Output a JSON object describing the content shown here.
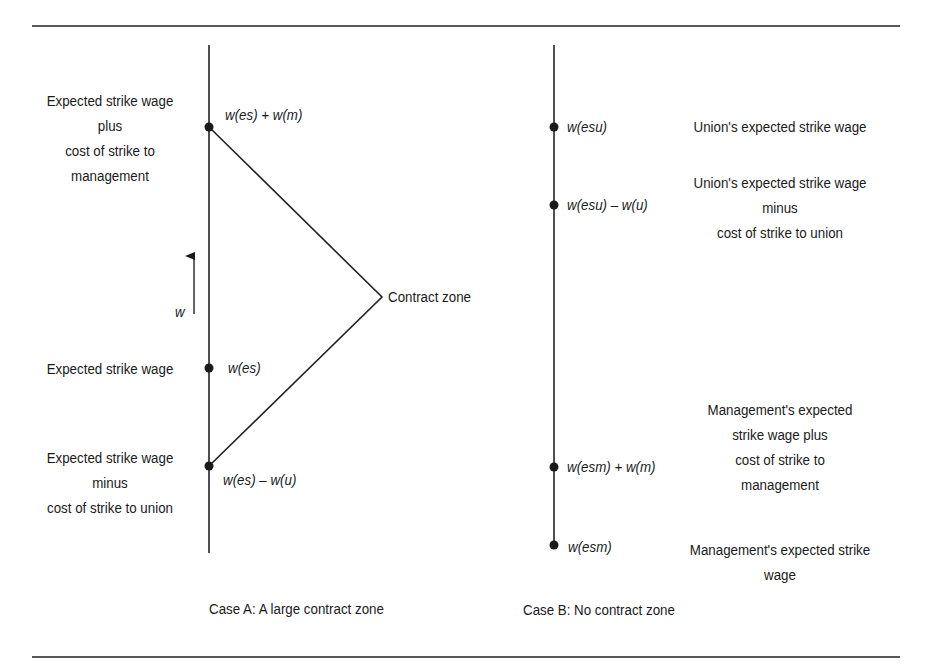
{
  "figure": {
    "rules": {
      "top_y": 26,
      "bottom_y": 657,
      "x_start": 32,
      "x_end": 900,
      "color": "#222222"
    },
    "case_a": {
      "caption": "Case A: A large contract zone",
      "axis": {
        "x": 209,
        "y_top": 45,
        "y_bottom": 553
      },
      "arrow": {
        "label": "w",
        "x": 194,
        "y_from": 314,
        "y_to": 254
      },
      "apex": {
        "x": 382,
        "y": 297,
        "label": "Contract zone"
      },
      "points": [
        {
          "y": 127,
          "math": "w(es) + w(m)",
          "desc_lines": [
            "Expected strike wage",
            "plus",
            "cost of strike to",
            "management"
          ]
        },
        {
          "y": 368,
          "math": "w(es)",
          "desc_lines": [
            "Expected strike wage"
          ]
        },
        {
          "y": 466,
          "math": "w(es) – w(u)",
          "desc_lines": [
            "Expected strike wage",
            "minus",
            "cost of strike to union"
          ]
        }
      ]
    },
    "case_b": {
      "caption": "Case B: No contract zone",
      "axis": {
        "x": 554,
        "y_top": 45,
        "y_bottom": 545
      },
      "points": [
        {
          "y": 127,
          "math": "w(esu)",
          "desc_lines": [
            "Union's expected strike wage"
          ]
        },
        {
          "y": 205,
          "math": "w(esu) – w(u)",
          "desc_lines": [
            "Union's expected strike wage",
            "minus",
            "cost of strike to union"
          ]
        },
        {
          "y": 467,
          "math": "w(esm) + w(m)",
          "desc_lines": [
            "Management's expected",
            "strike wage plus",
            "cost of strike to",
            "management"
          ]
        },
        {
          "y": 545,
          "math": "w(esm)",
          "desc_lines": [
            "Management's expected strike",
            "wage"
          ]
        }
      ]
    }
  }
}
